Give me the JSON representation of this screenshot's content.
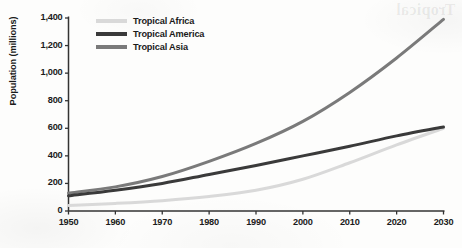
{
  "artifacts": {
    "bleed_through_text": "Tropical"
  },
  "chart_data": {
    "type": "line",
    "title": "",
    "xlabel": "",
    "ylabel": "Population (millions)",
    "xlim": [
      1950,
      2030
    ],
    "ylim": [
      0,
      1400
    ],
    "grid": false,
    "legend_position": "top-left-inside",
    "x_tick_labels": [
      "1950",
      "1960",
      "1970",
      "1980",
      "1990",
      "2000",
      "2010",
      "2020",
      "2030"
    ],
    "y_tick_labels": [
      "0",
      "200",
      "400",
      "600",
      "800",
      "1,000",
      "1,200",
      "1,400"
    ],
    "x_ticks": [
      1950,
      1960,
      1970,
      1980,
      1990,
      2000,
      2010,
      2020,
      2030
    ],
    "y_ticks": [
      0,
      200,
      400,
      600,
      800,
      1000,
      1200,
      1400
    ],
    "x": [
      1950,
      1960,
      1970,
      1980,
      1990,
      2000,
      2010,
      2020,
      2030
    ],
    "series": [
      {
        "name": "Tropical Africa",
        "color": "#d9d9d9",
        "values": [
          40,
          55,
          75,
          105,
          150,
          230,
          350,
          480,
          600
        ]
      },
      {
        "name": "Tropical America",
        "color": "#3a3a3a",
        "values": [
          110,
          150,
          200,
          265,
          330,
          400,
          470,
          545,
          610
        ]
      },
      {
        "name": "Tropical Asia",
        "color": "#7a7a7a",
        "values": [
          130,
          175,
          250,
          360,
          490,
          650,
          860,
          1110,
          1390
        ]
      }
    ]
  }
}
